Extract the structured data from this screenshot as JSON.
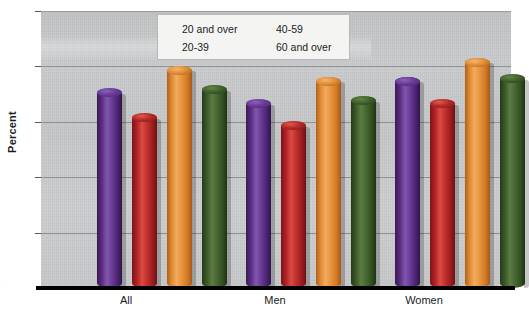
{
  "chart_data": {
    "type": "bar",
    "title": "",
    "xlabel": "",
    "ylabel": "Percent",
    "ylim": [
      0,
      50
    ],
    "yticks": [
      0,
      10,
      20,
      30,
      40,
      50
    ],
    "ytick_labels": [
      "0",
      "10",
      "20",
      "30",
      "40",
      "50"
    ],
    "grid": true,
    "legend_position": "top-center",
    "categories": [
      "All",
      "Men",
      "Women"
    ],
    "series": [
      {
        "name": "20 and over",
        "color": "#5b2d83",
        "values": [
          36.0,
          34.0,
          38.0
        ]
      },
      {
        "name": "20-39",
        "color": "#b02226",
        "values": [
          31.5,
          30.0,
          34.0
        ]
      },
      {
        "name": "40-59",
        "color": "#e8913a",
        "values": [
          40.0,
          38.0,
          41.5
        ]
      },
      {
        "name": "60 and over",
        "color": "#3f5a2e",
        "values": [
          36.5,
          34.5,
          38.5
        ]
      }
    ]
  },
  "axis": {
    "y_title": "Percent",
    "y_labels": [
      "50",
      "40",
      "30",
      "20",
      "10",
      "0"
    ]
  },
  "legend": {
    "items": [
      {
        "label": "20 and over",
        "swatch": "purple"
      },
      {
        "label": "40-59",
        "swatch": "orange"
      },
      {
        "label": "20-39",
        "swatch": "red"
      },
      {
        "label": "60 and over",
        "swatch": "green"
      }
    ]
  },
  "x_axis": {
    "labels": [
      "All",
      "Men",
      "Women"
    ]
  },
  "colors": {
    "purple": "#5b2d83",
    "red": "#b02226",
    "orange": "#e8913a",
    "green": "#3f5a2e",
    "plot_background": "#c7c8ca",
    "axis_line": "#000000",
    "gridline": "#8f9092",
    "legend_background": "#f4f4f2"
  }
}
